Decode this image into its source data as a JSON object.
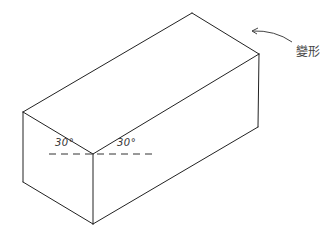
{
  "diagram": {
    "type": "isometric-box",
    "stroke_color": "#222222",
    "vertices": {
      "top_back": [
        192,
        13
      ],
      "right_top": [
        259,
        54
      ],
      "right_bottom": [
        258,
        127
      ],
      "left_top": [
        23,
        112
      ],
      "left_bottom": [
        23,
        182
      ],
      "front_top": [
        93,
        154
      ],
      "front_bottom": [
        93,
        224
      ]
    },
    "angle_left_label": "30°",
    "angle_right_label": "30°",
    "callout_label": "變形"
  }
}
